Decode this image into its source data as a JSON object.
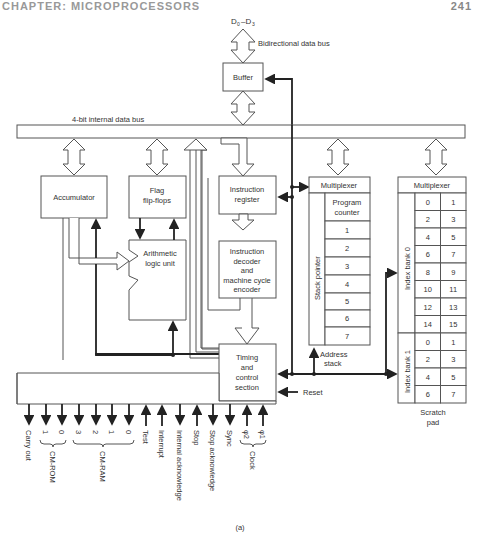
{
  "page": {
    "header_left": "CHAPTER: MICROPROCESSORS",
    "page_number": "241",
    "caption": "(a)"
  },
  "bus": {
    "external_label": "D0–D3",
    "external_sub0": "0",
    "external_sub3": "3",
    "bidirectional_label": "Bidirectional data bus",
    "internal_label": "4-bit internal data bus"
  },
  "blocks": {
    "buffer": "Buffer",
    "accumulator": "Accumulator",
    "flag_line1": "Flag",
    "flag_line2": "flip-flops",
    "alu_line1": "Arithmetic",
    "alu_line2": "logic unit",
    "ir_line1": "Instruction",
    "ir_line2": "register",
    "decoder_lines": [
      "Instruction",
      "decoder",
      "and",
      "machine cycle",
      "encoder"
    ],
    "timing_lines": [
      "Timing",
      "and",
      "control",
      "section"
    ],
    "reset": "Reset"
  },
  "stack": {
    "multiplexer": "Multiplexer",
    "side_label": "Stack pointer",
    "pc_line1": "Program",
    "pc_line2": "counter",
    "levels": [
      "1",
      "2",
      "3",
      "4",
      "5",
      "6",
      "7"
    ],
    "address_line1": "Address",
    "address_line2": "stack"
  },
  "scratchpad": {
    "multiplexer": "Multiplexer",
    "bank0_label": "Index bank 0",
    "bank0": [
      [
        "0",
        "1"
      ],
      [
        "2",
        "3"
      ],
      [
        "4",
        "5"
      ],
      [
        "6",
        "7"
      ],
      [
        "8",
        "9"
      ],
      [
        "10",
        "11"
      ],
      [
        "12",
        "13"
      ],
      [
        "14",
        "15"
      ]
    ],
    "bank1_label": "Index bank 1",
    "bank1": [
      [
        "0",
        "1"
      ],
      [
        "2",
        "3"
      ],
      [
        "4",
        "5"
      ],
      [
        "6",
        "7"
      ]
    ],
    "caption_line1": "Scratch",
    "caption_line2": "pad"
  },
  "signals": {
    "carry_out": "Carry out",
    "cm_rom_bits": [
      "1",
      "0"
    ],
    "cm_rom": "CM-ROM",
    "cm_ram_bits": [
      "3",
      "2",
      "1",
      "0"
    ],
    "cm_ram": "CM-RAM",
    "test": "Test",
    "interrupt": "Interrupt",
    "internal_ack": "Internal acknowledge",
    "stop": "Stop",
    "stop_ack": "Stop acknowledge",
    "sync": "Sync",
    "phi2": "φ2",
    "phi1": "φ1",
    "clock": "Clock"
  }
}
